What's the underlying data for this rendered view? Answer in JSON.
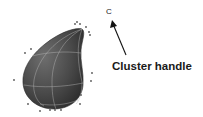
{
  "figure": {
    "label": "Cluster handle",
    "handle_marker": "C",
    "object": "teardrop-nurbs-surface",
    "colors": {
      "surface": "#4a4a4a",
      "surface_highlight": "#7a7a7a",
      "isoparm": "#bdbdbd",
      "cv_point": "#555555",
      "arrow": "#111111",
      "text": "#1a1a1a"
    }
  }
}
